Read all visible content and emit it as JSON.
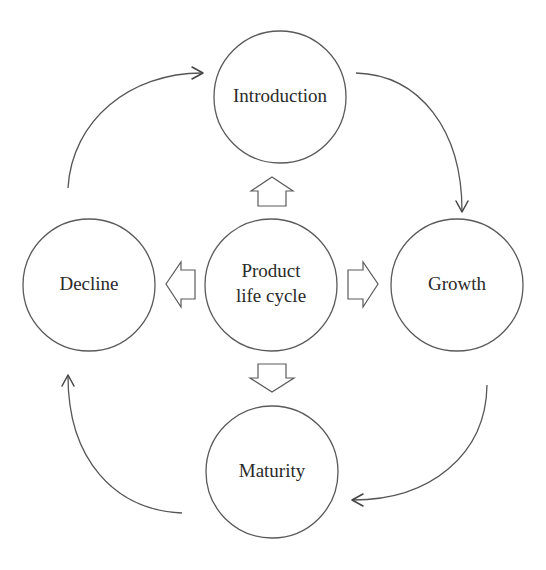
{
  "diagram": {
    "title": "Product life cycle",
    "center": {
      "id": "center",
      "lines": [
        "Product",
        "life cycle"
      ]
    },
    "stages": [
      {
        "id": "introduction",
        "label": "Introduction",
        "position": "top"
      },
      {
        "id": "growth",
        "label": "Growth",
        "position": "right"
      },
      {
        "id": "maturity",
        "label": "Maturity",
        "position": "bottom"
      },
      {
        "id": "decline",
        "label": "Decline",
        "position": "left"
      }
    ],
    "block_arrows": [
      {
        "from": "center",
        "to": "introduction",
        "direction": "up"
      },
      {
        "from": "center",
        "to": "growth",
        "direction": "right"
      },
      {
        "from": "center",
        "to": "maturity",
        "direction": "down"
      },
      {
        "from": "center",
        "to": "decline",
        "direction": "left"
      }
    ],
    "cycle_arrows": [
      {
        "from": "introduction",
        "to": "growth",
        "rotation": "clockwise"
      },
      {
        "from": "growth",
        "to": "maturity",
        "rotation": "clockwise"
      },
      {
        "from": "maturity",
        "to": "decline",
        "rotation": "clockwise"
      },
      {
        "from": "decline",
        "to": "introduction",
        "rotation": "clockwise"
      }
    ],
    "colors": {
      "stroke": "#5a5a5a",
      "text": "#2a2a2a",
      "background": "#ffffff"
    }
  }
}
